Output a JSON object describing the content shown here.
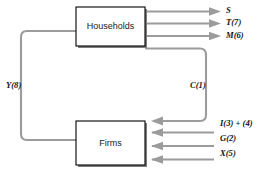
{
  "diagram": {
    "colors": {
      "flow_line": "#9b9b9b",
      "box_border": "#000000",
      "box_fill": "#ffffff",
      "box_shadow": "#7d7d7d",
      "text": "#141414",
      "background": "#ffffff"
    },
    "nodes": [
      {
        "id": "households",
        "label": "Households"
      },
      {
        "id": "firms",
        "label": "Firms"
      }
    ],
    "outflows_from_households": [
      {
        "id": "saving",
        "label": "S"
      },
      {
        "id": "taxes",
        "label": "T(7)"
      },
      {
        "id": "imports",
        "label": "M(6)"
      }
    ],
    "inflows_to_firms": [
      {
        "id": "investment",
        "label": "I(3) + (4)"
      },
      {
        "id": "government",
        "label": "G(2)"
      },
      {
        "id": "exports",
        "label": "X(5)"
      }
    ],
    "consumption_flow": {
      "id": "consumption",
      "label": "C(1)"
    },
    "income_flow": {
      "id": "income",
      "label": "Y(8)"
    }
  }
}
